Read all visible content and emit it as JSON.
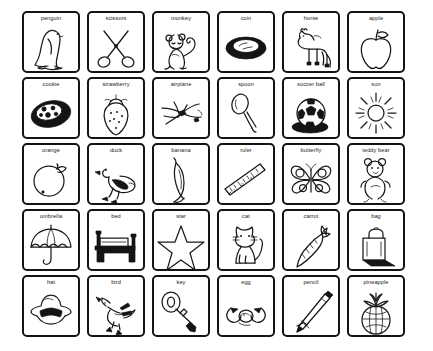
{
  "document": {
    "title": "Picture Vocabulary Flashcard Sheet",
    "background_color": "#ffffff",
    "ink_color": "#1a1a1a",
    "grid": {
      "columns": 6,
      "rows": 5,
      "total_cards": 30
    }
  },
  "cards": [
    {
      "label": "penguin",
      "icon": "penguin-icon",
      "row": 1,
      "col": 1
    },
    {
      "label": "scissors",
      "icon": "scissors-icon",
      "row": 1,
      "col": 2
    },
    {
      "label": "monkey",
      "icon": "monkey-icon",
      "row": 1,
      "col": 3
    },
    {
      "label": "coin",
      "icon": "coin-icon",
      "row": 1,
      "col": 4
    },
    {
      "label": "horse",
      "icon": "horse-icon",
      "row": 1,
      "col": 5
    },
    {
      "label": "apple",
      "icon": "apple-icon",
      "row": 1,
      "col": 6
    },
    {
      "label": "cookie",
      "icon": "cookie-icon",
      "row": 2,
      "col": 1
    },
    {
      "label": "strawberry",
      "icon": "strawberry-icon",
      "row": 2,
      "col": 2
    },
    {
      "label": "airplane",
      "icon": "airplane-icon",
      "row": 2,
      "col": 3
    },
    {
      "label": "spoon",
      "icon": "spoon-icon",
      "row": 2,
      "col": 4
    },
    {
      "label": "soccer ball",
      "icon": "soccer-ball-icon",
      "row": 2,
      "col": 5
    },
    {
      "label": "sun",
      "icon": "sun-icon",
      "row": 2,
      "col": 6
    },
    {
      "label": "orange",
      "icon": "orange-icon",
      "row": 3,
      "col": 1
    },
    {
      "label": "duck",
      "icon": "duck-icon",
      "row": 3,
      "col": 2
    },
    {
      "label": "banana",
      "icon": "banana-icon",
      "row": 3,
      "col": 3
    },
    {
      "label": "ruler",
      "icon": "ruler-icon",
      "row": 3,
      "col": 4
    },
    {
      "label": "butterfly",
      "icon": "butterfly-icon",
      "row": 3,
      "col": 5
    },
    {
      "label": "teddy bear",
      "icon": "teddy-bear-icon",
      "row": 3,
      "col": 6
    },
    {
      "label": "umbrella",
      "icon": "umbrella-icon",
      "row": 4,
      "col": 1
    },
    {
      "label": "bed",
      "icon": "bed-icon",
      "row": 4,
      "col": 2
    },
    {
      "label": "star",
      "icon": "star-icon",
      "row": 4,
      "col": 3
    },
    {
      "label": "cat",
      "icon": "cat-icon",
      "row": 4,
      "col": 4
    },
    {
      "label": "carrot",
      "icon": "carrot-icon",
      "row": 4,
      "col": 5
    },
    {
      "label": "bag",
      "icon": "bag-icon",
      "row": 4,
      "col": 6
    },
    {
      "label": "hat",
      "icon": "hat-icon",
      "row": 5,
      "col": 1
    },
    {
      "label": "bird",
      "icon": "bird-icon",
      "row": 5,
      "col": 2
    },
    {
      "label": "key",
      "icon": "key-icon",
      "row": 5,
      "col": 3
    },
    {
      "label": "egg",
      "icon": "egg-icon",
      "row": 5,
      "col": 4
    },
    {
      "label": "pencil",
      "icon": "pencil-icon",
      "row": 5,
      "col": 5
    },
    {
      "label": "pineapple",
      "icon": "pineapple-icon",
      "row": 5,
      "col": 6
    }
  ]
}
